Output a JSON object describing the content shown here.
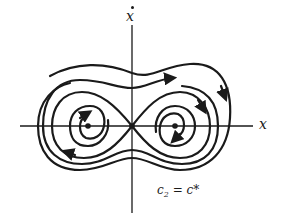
{
  "diagram": {
    "type": "phase-portrait",
    "axes": {
      "horizontal_label": "x",
      "vertical_label": "x",
      "vertical_label_has_dot": true
    },
    "parameter_label": {
      "var": "c",
      "subscript": "2",
      "equals": " = ",
      "value": "c*"
    },
    "equilibria": [
      {
        "name": "saddle",
        "x": 132,
        "y": 126
      },
      {
        "name": "left-center",
        "x": 88,
        "y": 126
      },
      {
        "name": "right-center",
        "x": 175,
        "y": 126
      }
    ],
    "trajectories": [
      "outer-open-orbit-top",
      "outer-closed-orbit",
      "separatrix-figure-eight",
      "left-spiral",
      "right-spiral"
    ],
    "colors": {
      "stroke": "#1a1a1a",
      "background": "#ffffff"
    }
  }
}
